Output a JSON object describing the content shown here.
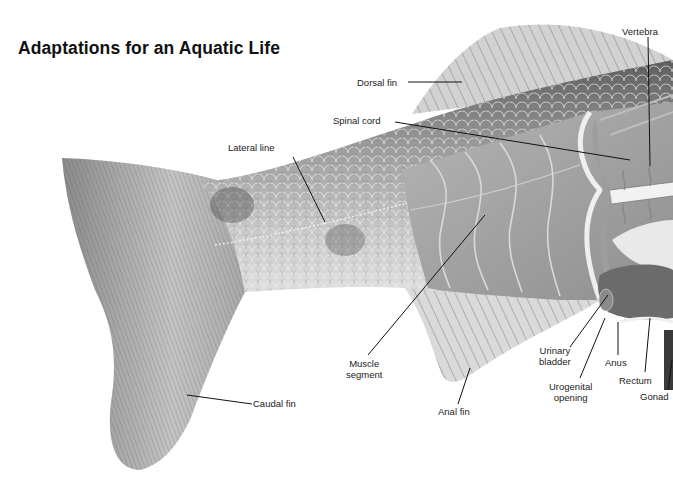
{
  "figure": {
    "title": "Adaptations for an Aquatic Life",
    "labels": {
      "vertebra": "Vertebra",
      "dorsal_fin": "Dorsal fin",
      "spinal_cord": "Spinal cord",
      "lateral_line": "Lateral line",
      "muscle_segment_1": "Muscle",
      "muscle_segment_2": "segment",
      "caudal_fin": "Caudal fin",
      "anal_fin": "Anal fin",
      "urinary_bladder_1": "Urinary",
      "urinary_bladder_2": "bladder",
      "urogenital_opening_1": "Urogenital",
      "urogenital_opening_2": "opening",
      "anus": "Anus",
      "rectum": "Rectum",
      "gonad": "Gonad"
    },
    "colors": {
      "background": "#ffffff",
      "text": "#222222",
      "leader_line": "#111111",
      "scale_light": "#c9c9c9",
      "scale_dark": "#6f6f6f",
      "muscle": "#a9a9a9",
      "fin": "#d8d8d8"
    }
  }
}
